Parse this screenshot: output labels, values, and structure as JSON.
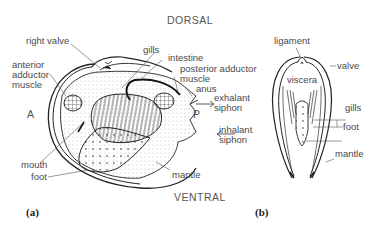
{
  "figure_a": {
    "panel_label": "(a)",
    "orientation": {
      "top": "DORSAL",
      "bottom": "VENTRAL",
      "left": "A",
      "right": "P"
    },
    "labels": {
      "right_valve": "right valve",
      "gills": "gills",
      "intestine": "intestine",
      "posterior_adductor_1": "posterior adductor",
      "posterior_adductor_2": "muscle",
      "anus": "anus",
      "exhalant_1": "exhalant",
      "exhalant_2": "siphon",
      "inhalant_1": "inhalant",
      "inhalant_2": "siphon",
      "anterior_adductor_1": "anterior",
      "anterior_adductor_2": "adductor",
      "anterior_adductor_3": "muscle",
      "mouth": "mouth",
      "foot": "foot",
      "mantle": "mantle"
    }
  },
  "figure_b": {
    "panel_label": "(b)",
    "labels": {
      "ligament": "ligament",
      "valve": "valve",
      "viscera": "viscera",
      "gills": "gills",
      "foot": "foot",
      "mantle": "mantle"
    }
  }
}
